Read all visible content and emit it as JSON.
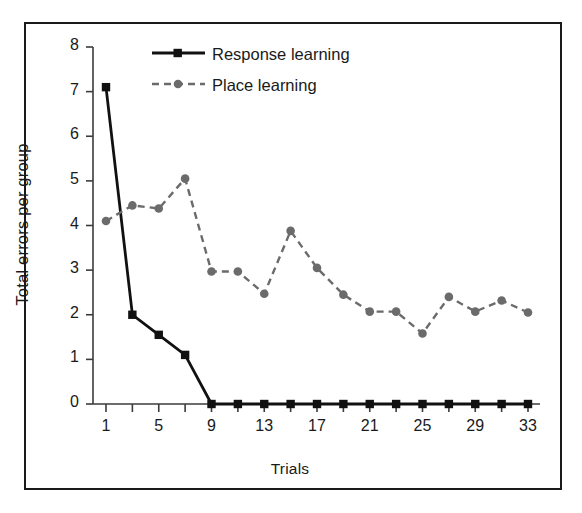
{
  "chart_data": {
    "type": "line",
    "title": "",
    "xlabel": "Trials",
    "ylabel": "Total errors per group",
    "xlim": [
      0,
      34
    ],
    "ylim": [
      0,
      8
    ],
    "grid": false,
    "legend_position": "top-center",
    "x_tick_labels": [
      "1",
      "5",
      "9",
      "13",
      "17",
      "21",
      "25",
      "29",
      "33"
    ],
    "x_tick_values": [
      1,
      5,
      9,
      13,
      17,
      21,
      25,
      29,
      33
    ],
    "x_minor_ticks": [
      1,
      3,
      5,
      7,
      9,
      11,
      13,
      15,
      17,
      19,
      21,
      23,
      25,
      27,
      29,
      31,
      33
    ],
    "y_tick_labels": [
      "0",
      "1",
      "2",
      "3",
      "4",
      "5",
      "6",
      "7",
      "8"
    ],
    "y_tick_values": [
      0,
      1,
      2,
      3,
      4,
      5,
      6,
      7,
      8
    ],
    "x": [
      1,
      3,
      5,
      7,
      9,
      11,
      13,
      15,
      17,
      19,
      21,
      23,
      25,
      27,
      29,
      31,
      33
    ],
    "series": [
      {
        "name": "Response learning",
        "color": "#111111",
        "line_style": "solid",
        "marker": "square",
        "values": [
          7.1,
          2.0,
          1.55,
          1.1,
          0.0,
          0.0,
          0.0,
          0.0,
          0.0,
          0.0,
          0.0,
          0.0,
          0.0,
          0.0,
          0.0,
          0.0,
          0.0
        ]
      },
      {
        "name": "Place learning",
        "color": "#6b6b6b",
        "line_style": "dashed",
        "marker": "circle",
        "values": [
          4.1,
          4.45,
          4.38,
          5.05,
          2.97,
          2.97,
          2.47,
          3.88,
          3.05,
          2.45,
          2.07,
          2.07,
          1.58,
          2.4,
          2.07,
          2.32,
          2.05
        ]
      }
    ]
  },
  "legend": {
    "entries": [
      {
        "label": "Response learning"
      },
      {
        "label": "Place learning"
      }
    ]
  }
}
